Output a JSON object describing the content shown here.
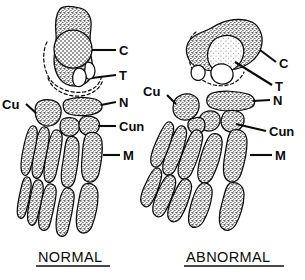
{
  "figure": {
    "title": "",
    "type": "anatomical-line-drawing",
    "panels": [
      {
        "id": "normal",
        "caption": "NORMAL",
        "caption_underlined": true,
        "labels": [
          {
            "key": "C",
            "text": "C",
            "meaning": "calcaneus"
          },
          {
            "key": "T",
            "text": "T",
            "meaning": "talus"
          },
          {
            "key": "N",
            "text": "N",
            "meaning": "navicular"
          },
          {
            "key": "Cu",
            "text": "Cu",
            "meaning": "cuboid"
          },
          {
            "key": "Cun",
            "text": "Cun",
            "meaning": "cuneiform"
          },
          {
            "key": "M",
            "text": "M",
            "meaning": "metatarsal"
          }
        ]
      },
      {
        "id": "abnormal",
        "caption": "ABNORMAL",
        "caption_underlined": true,
        "labels": [
          {
            "key": "C",
            "text": "C",
            "meaning": "calcaneus"
          },
          {
            "key": "T",
            "text": "T",
            "meaning": "talus"
          },
          {
            "key": "N",
            "text": "N",
            "meaning": "navicular"
          },
          {
            "key": "Cu",
            "text": "Cu",
            "meaning": "cuboid"
          },
          {
            "key": "Cun",
            "text": "Cun",
            "meaning": "cuneiform"
          },
          {
            "key": "M",
            "text": "M",
            "meaning": "metatarsal"
          }
        ]
      }
    ],
    "colors": {
      "ink": "#0b0b0b",
      "background": "#ffffff",
      "stipple": "#6b6b6b"
    }
  }
}
